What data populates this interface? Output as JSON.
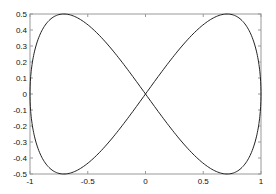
{
  "chart_data": {
    "type": "line",
    "title": "",
    "xlabel": "",
    "ylabel": "",
    "xlim": [
      -1,
      1
    ],
    "ylim": [
      -0.5,
      0.5
    ],
    "grid": false,
    "legend": null,
    "x_ticks": [
      "-1",
      "-0.5",
      "0",
      "0.5",
      "1"
    ],
    "y_ticks": [
      "-0.5",
      "-0.4",
      "-0.3",
      "-0.2",
      "-0.1",
      "0",
      "0.1",
      "0.2",
      "0.3",
      "0.4",
      "0.5"
    ],
    "series": [
      {
        "name": "figure-eight curve",
        "description": "x = sin(t), y = 0.5*sin(2t), t in [0, 2π]",
        "x": [
          0,
          0.383,
          0.707,
          0.924,
          1,
          0.924,
          0.707,
          0.383,
          0,
          -0.383,
          -0.707,
          -0.924,
          -1,
          -0.924,
          -0.707,
          -0.383,
          0
        ],
        "y": [
          0,
          0.354,
          0.5,
          0.354,
          0,
          -0.354,
          -0.5,
          -0.354,
          0,
          0.354,
          0.5,
          0.354,
          0,
          -0.354,
          -0.5,
          -0.354,
          0
        ],
        "color": "#222222"
      }
    ]
  }
}
